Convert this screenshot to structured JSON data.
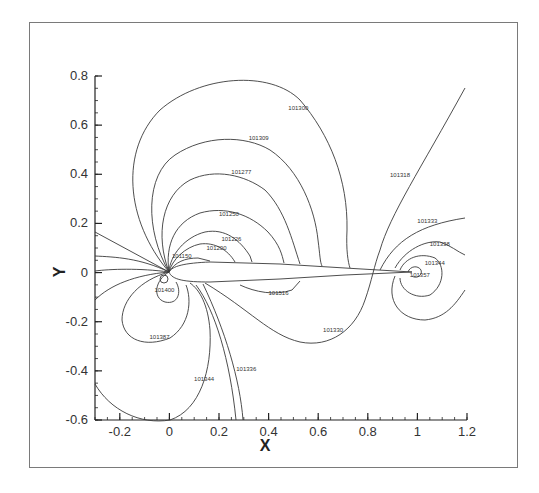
{
  "chart_data": {
    "type": "contour",
    "title": "",
    "xlabel": "X",
    "ylabel": "Y",
    "xlim": [
      -0.3,
      1.2
    ],
    "ylim": [
      -0.6,
      0.8
    ],
    "x_ticks": [
      "-0.2",
      "0",
      "0.2",
      "0.4",
      "0.6",
      "0.8",
      "1",
      "1.2"
    ],
    "x_tick_values": [
      -0.2,
      0,
      0.2,
      0.4,
      0.6,
      0.8,
      1.0,
      1.2
    ],
    "y_ticks": [
      "0.8",
      "0.6",
      "0.4",
      "0.2",
      "0",
      "-0.2",
      "-0.4",
      "-0.6"
    ],
    "y_tick_values": [
      0.8,
      0.6,
      0.4,
      0.2,
      0,
      -0.2,
      -0.4,
      -0.6
    ],
    "grid": false,
    "legend": "none",
    "body": "airfoil, chord 0 to 1",
    "contour_labels": [
      {
        "text": "101300",
        "x": 0.52,
        "y": 0.66
      },
      {
        "text": "101309",
        "x": 0.36,
        "y": 0.54
      },
      {
        "text": "101277",
        "x": 0.29,
        "y": 0.4
      },
      {
        "text": "101250",
        "x": 0.24,
        "y": 0.23
      },
      {
        "text": "101226",
        "x": 0.25,
        "y": 0.13
      },
      {
        "text": "101200",
        "x": 0.19,
        "y": 0.09
      },
      {
        "text": "101150",
        "x": 0.05,
        "y": 0.06
      },
      {
        "text": "101400",
        "x": -0.02,
        "y": -0.08
      },
      {
        "text": "101516",
        "x": 0.44,
        "y": -0.09
      },
      {
        "text": "101387",
        "x": -0.04,
        "y": -0.27
      },
      {
        "text": "101344",
        "x": 0.14,
        "y": -0.44
      },
      {
        "text": "101336",
        "x": 0.31,
        "y": -0.4
      },
      {
        "text": "101330",
        "x": 0.66,
        "y": -0.24
      },
      {
        "text": "101318",
        "x": 0.93,
        "y": 0.39
      },
      {
        "text": "101333",
        "x": 1.04,
        "y": 0.2
      },
      {
        "text": "101338",
        "x": 1.09,
        "y": 0.11
      },
      {
        "text": "101344",
        "x": 1.07,
        "y": 0.03
      },
      {
        "text": "101357",
        "x": 1.01,
        "y": -0.02
      }
    ]
  }
}
